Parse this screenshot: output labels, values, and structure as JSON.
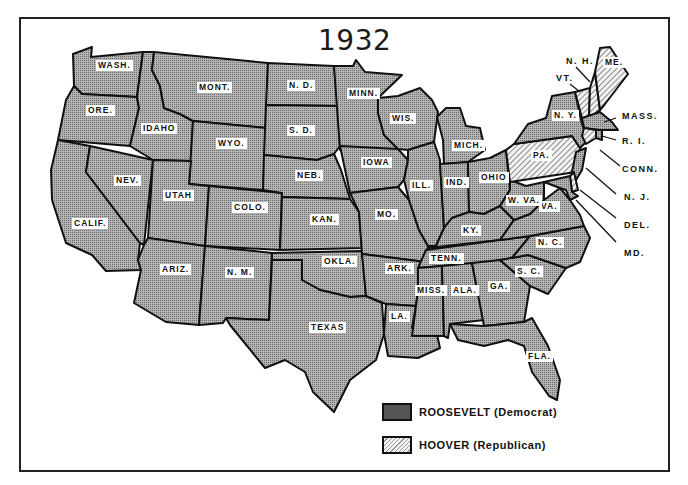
{
  "title": "1932",
  "colors": {
    "democrat_fill": "#a8a8a8",
    "republican_fill": "#efefef",
    "border": "#111111"
  },
  "legend": [
    {
      "party": "democrat",
      "label": "ROOSEVELT (Democrat)",
      "pattern": "dotted"
    },
    {
      "party": "republican",
      "label": "HOOVER (Republican)",
      "pattern": "hatched"
    }
  ],
  "states": {
    "wash": {
      "label": "WASH.",
      "winner": "Roosevelt"
    },
    "ore": {
      "label": "ORE.",
      "winner": "Roosevelt"
    },
    "calif": {
      "label": "CALIF.",
      "winner": "Roosevelt"
    },
    "nev": {
      "label": "NEV.",
      "winner": "Roosevelt"
    },
    "idaho": {
      "label": "IDAHO",
      "winner": "Roosevelt"
    },
    "mont": {
      "label": "MONT.",
      "winner": "Roosevelt"
    },
    "wyo": {
      "label": "WYO.",
      "winner": "Roosevelt"
    },
    "utah": {
      "label": "UTAH",
      "winner": "Roosevelt"
    },
    "ariz": {
      "label": "ARIZ.",
      "winner": "Roosevelt"
    },
    "colo": {
      "label": "COLO.",
      "winner": "Roosevelt"
    },
    "nm": {
      "label": "N. M.",
      "winner": "Roosevelt"
    },
    "nd": {
      "label": "N. D.",
      "winner": "Roosevelt"
    },
    "sd": {
      "label": "S. D.",
      "winner": "Roosevelt"
    },
    "neb": {
      "label": "NEB.",
      "winner": "Roosevelt"
    },
    "kan": {
      "label": "KAN.",
      "winner": "Roosevelt"
    },
    "okla": {
      "label": "OKLA.",
      "winner": "Roosevelt"
    },
    "texas": {
      "label": "TEXAS",
      "winner": "Roosevelt"
    },
    "minn": {
      "label": "MINN.",
      "winner": "Roosevelt"
    },
    "iowa": {
      "label": "IOWA",
      "winner": "Roosevelt"
    },
    "mo": {
      "label": "MO.",
      "winner": "Roosevelt"
    },
    "ark": {
      "label": "ARK.",
      "winner": "Roosevelt"
    },
    "la": {
      "label": "LA.",
      "winner": "Roosevelt"
    },
    "wis": {
      "label": "WIS.",
      "winner": "Roosevelt"
    },
    "ill": {
      "label": "ILL.",
      "winner": "Roosevelt"
    },
    "mich": {
      "label": "MICH.",
      "winner": "Roosevelt"
    },
    "ind": {
      "label": "IND.",
      "winner": "Roosevelt"
    },
    "ohio": {
      "label": "OHIO",
      "winner": "Roosevelt"
    },
    "ky": {
      "label": "KY.",
      "winner": "Roosevelt"
    },
    "tenn": {
      "label": "TENN.",
      "winner": "Roosevelt"
    },
    "miss": {
      "label": "MISS.",
      "winner": "Roosevelt"
    },
    "ala": {
      "label": "ALA.",
      "winner": "Roosevelt"
    },
    "ga": {
      "label": "GA.",
      "winner": "Roosevelt"
    },
    "fla": {
      "label": "FLA.",
      "winner": "Roosevelt"
    },
    "sc": {
      "label": "S. C.",
      "winner": "Roosevelt"
    },
    "nc": {
      "label": "N. C.",
      "winner": "Roosevelt"
    },
    "va": {
      "label": "VA.",
      "winner": "Roosevelt"
    },
    "wva": {
      "label": "W. VA.",
      "winner": "Roosevelt"
    },
    "pa": {
      "label": "PA.",
      "winner": "Hoover"
    },
    "ny": {
      "label": "N. Y.",
      "winner": "Roosevelt"
    },
    "vt": {
      "label": "VT.",
      "winner": "Hoover"
    },
    "nh": {
      "label": "N. H.",
      "winner": "Hoover"
    },
    "me": {
      "label": "ME.",
      "winner": "Hoover"
    },
    "mass": {
      "label": "MASS.",
      "winner": "Roosevelt"
    },
    "ri": {
      "label": "R. I.",
      "winner": "Roosevelt"
    },
    "conn": {
      "label": "CONN.",
      "winner": "Hoover"
    },
    "nj": {
      "label": "N. J.",
      "winner": "Roosevelt"
    },
    "del": {
      "label": "DEL.",
      "winner": "Hoover"
    },
    "md": {
      "label": "MD.",
      "winner": "Roosevelt"
    }
  }
}
